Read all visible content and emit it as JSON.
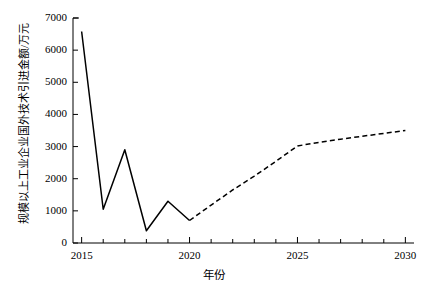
{
  "chart_data": {
    "type": "line",
    "title": "",
    "xlabel": "年份",
    "ylabel": "规模以上工业企业国外技术引进金额/万元",
    "xlim": [
      2014.6,
      2030.4
    ],
    "ylim": [
      0,
      7000
    ],
    "grid": false,
    "legend": "none",
    "xticks": [
      2015,
      2020,
      2025,
      2030
    ],
    "xtick_labels": [
      "2015",
      "2020",
      "2025",
      "2030"
    ],
    "xminor_step": 1,
    "yticks": [
      0,
      1000,
      2000,
      3000,
      4000,
      5000,
      6000,
      7000
    ],
    "ytick_labels": [
      "0",
      "1000",
      "2000",
      "3000",
      "4000",
      "5000",
      "6000",
      "7000"
    ],
    "x": [
      2015,
      2016,
      2017,
      2018,
      2019,
      2020,
      2021,
      2022,
      2023,
      2024,
      2025,
      2026,
      2027,
      2028,
      2029,
      2030
    ],
    "series": [
      {
        "name": "历史值",
        "style": "solid",
        "color": "#000000",
        "x": [
          2015,
          2016,
          2017,
          2018,
          2019,
          2020
        ],
        "values": [
          6580,
          1050,
          2900,
          380,
          1300,
          700
        ]
      },
      {
        "name": "预测值",
        "style": "dashed",
        "color": "#000000",
        "x": [
          2020,
          2021,
          2022,
          2023,
          2024,
          2025,
          2026,
          2027,
          2028,
          2029,
          2030
        ],
        "values": [
          700,
          1180,
          1650,
          2080,
          2540,
          3020,
          3130,
          3230,
          3320,
          3410,
          3500
        ]
      }
    ]
  },
  "axis": {
    "y_title": "规模以上工业企业国外技术引进金额/万元",
    "x_title": "年份"
  }
}
